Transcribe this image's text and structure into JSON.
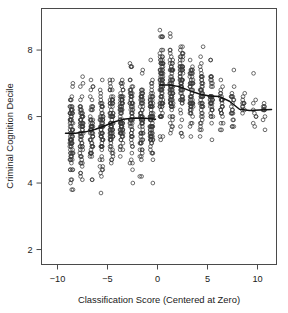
{
  "chart_data": {
    "type": "scatter",
    "title": "",
    "xlabel": "Classification Score (Centered at Zero)",
    "ylabel": "Criminal Cognition Decile",
    "xlim": [
      -11.6,
      11.9
    ],
    "ylim": [
      1.55,
      9.25
    ],
    "xticks": [
      -10,
      -5,
      0,
      5,
      10
    ],
    "xtick_labels": [
      "−10",
      "−5",
      "0",
      "5",
      "10"
    ],
    "yticks": [
      2,
      4,
      6,
      8
    ],
    "ytick_labels": [
      "2",
      "4",
      "6",
      "8"
    ],
    "grid": false,
    "legend": false,
    "marker": "open-circle",
    "columns": [
      {
        "x": -8.6,
        "n": 56,
        "ymin": 3.0,
        "ymax": 7.9,
        "ymid": 5.5
      },
      {
        "x": -7.6,
        "n": 44,
        "ymin": 2.95,
        "ymax": 7.6,
        "ymid": 5.55
      },
      {
        "x": -6.6,
        "n": 38,
        "ymin": 3.5,
        "ymax": 7.6,
        "ymid": 5.6
      },
      {
        "x": -5.6,
        "n": 46,
        "ymin": 3.05,
        "ymax": 8.0,
        "ymid": 5.7
      },
      {
        "x": -4.6,
        "n": 52,
        "ymin": 3.85,
        "ymax": 7.75,
        "ymid": 5.85
      },
      {
        "x": -3.6,
        "n": 50,
        "ymin": 3.85,
        "ymax": 7.6,
        "ymid": 5.95
      },
      {
        "x": -2.6,
        "n": 44,
        "ymin": 2.8,
        "ymax": 7.6,
        "ymid": 5.95
      },
      {
        "x": -1.6,
        "n": 46,
        "ymin": 3.05,
        "ymax": 7.45,
        "ymid": 5.92
      },
      {
        "x": -0.6,
        "n": 54,
        "ymin": 3.85,
        "ymax": 7.7,
        "ymid": 5.9
      },
      {
        "x": 0.4,
        "n": 58,
        "ymin": 4.35,
        "ymax": 8.9,
        "ymid": 6.95
      },
      {
        "x": 1.4,
        "n": 52,
        "ymin": 4.3,
        "ymax": 8.6,
        "ymid": 6.95
      },
      {
        "x": 2.4,
        "n": 46,
        "ymin": 4.5,
        "ymax": 8.4,
        "ymid": 6.9
      },
      {
        "x": 3.4,
        "n": 40,
        "ymin": 4.35,
        "ymax": 8.0,
        "ymid": 6.75
      },
      {
        "x": 4.4,
        "n": 34,
        "ymin": 4.45,
        "ymax": 8.3,
        "ymid": 6.65
      },
      {
        "x": 5.4,
        "n": 26,
        "ymin": 4.2,
        "ymax": 8.1,
        "ymid": 6.6
      },
      {
        "x": 6.4,
        "n": 18,
        "ymin": 4.6,
        "ymax": 7.6,
        "ymid": 6.45
      },
      {
        "x": 7.5,
        "n": 14,
        "ymin": 4.75,
        "ymax": 7.45,
        "ymid": 6.3
      },
      {
        "x": 8.6,
        "n": 8,
        "ymin": 5.2,
        "ymax": 6.7,
        "ymid": 6.2
      },
      {
        "x": 9.7,
        "n": 6,
        "ymin": 4.7,
        "ymax": 7.35,
        "ymid": 6.2
      },
      {
        "x": 10.7,
        "n": 7,
        "ymin": 4.2,
        "ymax": 6.65,
        "ymid": 6.2
      }
    ],
    "fit_line": {
      "name": "local average fit",
      "left_segment": {
        "x": [
          -9.2,
          -8.2,
          -7.2,
          -6.2,
          -5.2,
          -4.2,
          -3.2,
          -2.2,
          -1.2,
          -0.2
        ],
        "y": [
          5.5,
          5.5,
          5.54,
          5.62,
          5.73,
          5.85,
          5.93,
          5.96,
          5.95,
          5.92
        ]
      },
      "right_segment": {
        "x": [
          0.2,
          1.2,
          2.2,
          3.2,
          4.2,
          5.2,
          6.2,
          7.2,
          8.2,
          9.2,
          10.2,
          11.4
        ],
        "y": [
          6.95,
          6.95,
          6.9,
          6.78,
          6.68,
          6.62,
          6.6,
          6.46,
          6.22,
          6.18,
          6.2,
          6.21
        ]
      },
      "discontinuity_x": 0,
      "jump": 1.03
    }
  },
  "axes": {
    "x_label": "Classification Score (Centered at Zero)",
    "y_label": "Criminal Cognition Decile"
  }
}
